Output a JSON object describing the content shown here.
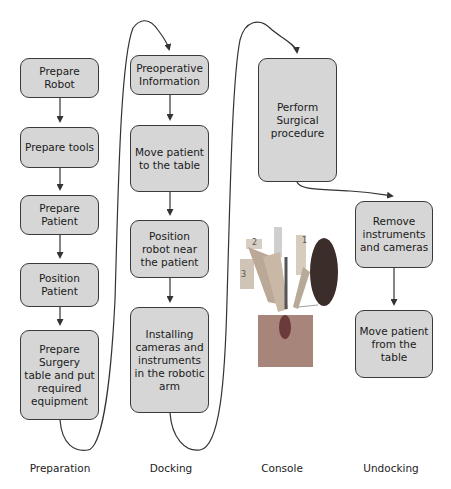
{
  "phases": [
    {
      "name": "Preparation",
      "steps": [
        "Prepare Robot",
        "Prepare tools",
        "Prepare Patient",
        "Position Patient",
        "Prepare Surgery table and put required equipment"
      ]
    },
    {
      "name": "Docking",
      "steps": [
        "Preoperative Information",
        "Move patient to the table",
        "Position robot near the patient",
        "Installing cameras and instruments in the robotic arm"
      ]
    },
    {
      "name": "Console",
      "steps": [
        "Perform Surgical procedure"
      ]
    },
    {
      "name": "Undocking",
      "steps": [
        "Remove instruments and cameras",
        "Move patient from the table"
      ]
    }
  ],
  "labels": {
    "preparation": "Preparation",
    "docking": "Docking",
    "console": "Console",
    "undocking": "Undocking"
  },
  "boxes": {
    "prepare_robot": "Prepare Robot",
    "prepare_tools": "Prepare tools",
    "prepare_patient": "Prepare Patient",
    "position_patient": "Position Patient",
    "prepare_surgery_table": "Prepare Surgery table and put required equipment",
    "preoperative_info": "Preoperative Information",
    "move_patient_to_table": "Move patient to the table",
    "position_robot": "Position robot near the patient",
    "installing_cameras": "Installing cameras and instruments in the robotic arm",
    "perform_surgery": "Perform Surgical procedure",
    "remove_instruments": "Remove instruments and cameras",
    "move_patient_from_table": "Move patient from the table"
  },
  "image": {
    "description": "Surgical robot arms with numbered arms 1, 2, 3 and camera inset",
    "arm_labels": [
      "1",
      "2",
      "3"
    ]
  }
}
